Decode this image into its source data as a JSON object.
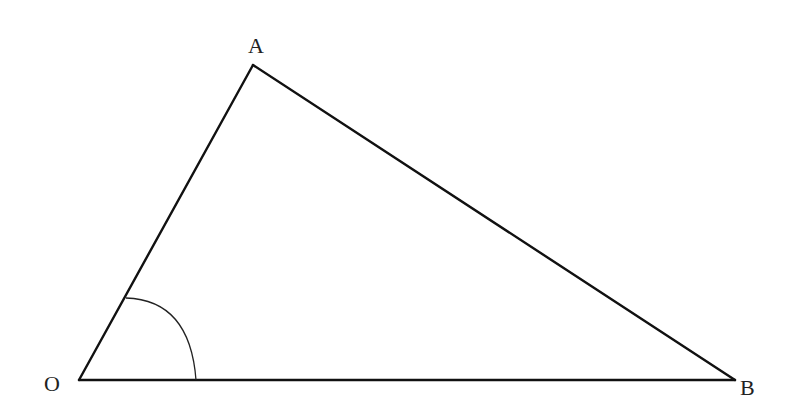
{
  "figure": {
    "type": "triangle",
    "stroke_color": "#111111",
    "background": "#ffffff",
    "vertices": {
      "A": {
        "label": "A",
        "x": 253,
        "y": 65
      },
      "O": {
        "label": "O",
        "x": 79,
        "y": 380
      },
      "B": {
        "label": "B",
        "x": 735,
        "y": 380
      }
    },
    "labels": {
      "A": "A",
      "O": "O",
      "B": "B"
    },
    "angle_marker": {
      "vertex": "O",
      "between": [
        "OA",
        "OB"
      ],
      "style": "arc"
    },
    "segments": [
      "OA",
      "AB",
      "OB"
    ]
  }
}
